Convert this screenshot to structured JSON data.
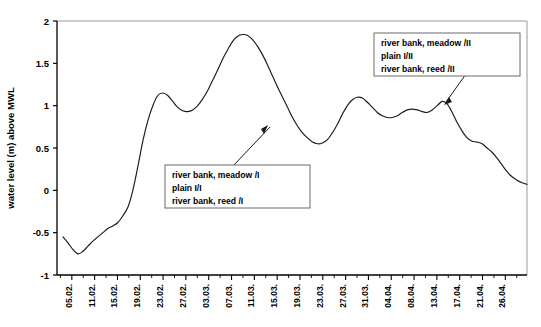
{
  "chart_data": {
    "type": "line",
    "title": "",
    "xlabel": "",
    "ylabel": "water level (m) above MWL",
    "ylim": [
      -1,
      2
    ],
    "yticks": [
      2,
      1.5,
      1,
      0.5,
      0,
      -0.5,
      -1
    ],
    "ytick_labels": [
      "2",
      "1.5",
      "1",
      "0.5",
      "0",
      "-0.5",
      "-1"
    ],
    "grid": false,
    "legend": "none",
    "categories": [
      "05.02.",
      "11.02.",
      "15.02.",
      "19.02.",
      "23.02.",
      "27.02.",
      "03.03.",
      "07.03.",
      "11.03.",
      "15.03.",
      "19.03.",
      "23.03.",
      "27.03.",
      "31.03.",
      "04.04.",
      "08.04.",
      "13.04.",
      "17.04.",
      "21.04.",
      "26.04."
    ],
    "series": [
      {
        "name": "water level",
        "x": [
          0,
          1,
          2,
          3,
          4,
          5,
          6,
          7,
          8,
          9,
          10,
          11,
          12,
          13,
          14,
          15,
          16,
          17,
          18,
          19,
          20,
          21,
          22,
          23,
          24,
          25,
          26,
          27,
          28,
          29,
          30,
          31,
          32,
          33,
          34,
          35,
          36,
          37,
          38,
          39,
          40,
          41,
          42,
          43,
          44,
          45,
          46,
          47,
          48,
          49,
          50,
          51,
          52,
          53,
          54,
          55,
          56,
          57,
          58,
          59,
          60,
          61,
          62,
          63,
          64,
          65,
          66,
          67,
          68,
          69,
          70,
          71,
          72,
          73,
          74,
          75,
          76,
          77,
          78,
          79,
          80,
          81,
          82,
          83
        ],
        "values": [
          -0.55,
          -0.62,
          -0.7,
          -0.75,
          -0.72,
          -0.66,
          -0.6,
          -0.55,
          -0.5,
          -0.45,
          -0.42,
          -0.38,
          -0.3,
          -0.2,
          0.0,
          0.28,
          0.58,
          0.82,
          1.0,
          1.12,
          1.15,
          1.12,
          1.05,
          0.98,
          0.94,
          0.93,
          0.95,
          1.0,
          1.08,
          1.18,
          1.3,
          1.42,
          1.55,
          1.66,
          1.76,
          1.82,
          1.84,
          1.83,
          1.78,
          1.7,
          1.6,
          1.48,
          1.35,
          1.22,
          1.1,
          0.98,
          0.86,
          0.76,
          0.68,
          0.62,
          0.57,
          0.55,
          0.56,
          0.6,
          0.68,
          0.78,
          0.9,
          1.0,
          1.07,
          1.1,
          1.09,
          1.04,
          0.98,
          0.92,
          0.88,
          0.86,
          0.86,
          0.88,
          0.92,
          0.95,
          0.96,
          0.95,
          0.93,
          0.92,
          0.95,
          1.0,
          1.05,
          1.02,
          0.92,
          0.8,
          0.7,
          0.62,
          0.58,
          0.57
        ]
      }
    ],
    "tail": {
      "values": [
        0.55,
        0.5,
        0.45,
        0.38,
        0.3,
        0.22,
        0.16,
        0.12,
        0.09,
        0.07
      ]
    },
    "annotations": [
      {
        "id": "annotation-series-I",
        "lines": [
          "river bank, meadow /I",
          "plain I/I",
          "river bank, reed /I"
        ],
        "arrow_from": [
          233,
          168
        ],
        "arrow_to": [
          268,
          126
        ]
      },
      {
        "id": "annotation-series-II",
        "lines": [
          "river bank, meadow /II",
          "plain I/II",
          "river bank, reed /II"
        ],
        "arrow_from": [
          466,
          72
        ],
        "arrow_to": [
          447,
          104
        ]
      }
    ],
    "colors": {
      "line": "#1a1a1a",
      "axis": "#000000",
      "frame": "#9a9a9a",
      "annotation_border": "#6b6b6b",
      "background": "#ffffff"
    }
  }
}
